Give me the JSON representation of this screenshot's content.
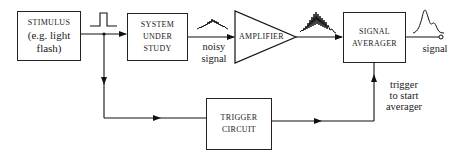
{
  "diagram": {
    "type": "block-diagram",
    "blocks": {
      "stimulus": {
        "line1": "STIMULUS",
        "line2": "(e.g. light",
        "line3": "flash)"
      },
      "system": {
        "line1": "SYSTEM",
        "line2": "UNDER",
        "line3": "STUDY"
      },
      "amplifier": {
        "label": "AMPLIFIER"
      },
      "averager": {
        "line1": "SIGNAL",
        "line2": "AVERAGER"
      },
      "trigger": {
        "line1": "TRIGGER",
        "line2": "CIRCUIT"
      }
    },
    "labels": {
      "noisy_line1": "noisy",
      "noisy_line2": "signal",
      "output_signal": "signal",
      "trigger_line1": "trigger",
      "trigger_line2": "to start",
      "trigger_line3": "averager"
    },
    "waveforms": [
      "square-pulse",
      "noisy-signal",
      "amplified-noisy-signal",
      "averaged-peak-signal"
    ],
    "connections": [
      "stimulus -> system",
      "system -> amplifier",
      "amplifier -> averager",
      "averager -> output",
      "stimulus junction -> trigger circuit",
      "trigger circuit -> averager"
    ]
  }
}
